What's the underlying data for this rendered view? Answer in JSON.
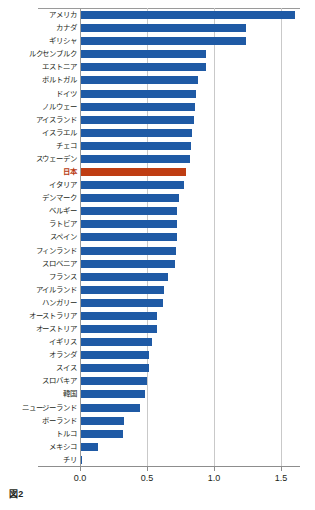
{
  "caption": "図2",
  "chart_data": {
    "type": "bar",
    "orientation": "horizontal",
    "title": "",
    "subtitle": "",
    "xlabel": "",
    "ylabel": "",
    "xlim": [
      0.0,
      1.75
    ],
    "xticks": [
      0.0,
      0.5,
      1.0,
      1.5
    ],
    "xtick_labels": [
      "0.0",
      "0.5",
      "1.0",
      "1.5"
    ],
    "grid": "vertical",
    "legend": "none",
    "bar_color": "#1f5aa5",
    "highlight_color": "#bf3d13",
    "highlight_category": "日本",
    "categories": [
      "アメリカ",
      "カナダ",
      "ギリシャ",
      "ルクセンブルク",
      "エストニア",
      "ポルトガル",
      "ドイツ",
      "ノルウェー",
      "アイスランド",
      "イスラエル",
      "チェコ",
      "スウェーデン",
      "日本",
      "イタリア",
      "デンマーク",
      "ベルギー",
      "ラトビア",
      "スペイン",
      "フィンランド",
      "スロベニア",
      "フランス",
      "アイルランド",
      "ハンガリー",
      "オーストラリア",
      "オーストリア",
      "イギリス",
      "オランダ",
      "スイス",
      "スロバキア",
      "韓国",
      "ニュージーランド",
      "ポーランド",
      "トルコ",
      "メキシコ",
      "チリ"
    ],
    "values": [
      1.6,
      1.23,
      1.23,
      0.93,
      0.93,
      0.87,
      0.86,
      0.85,
      0.84,
      0.83,
      0.82,
      0.81,
      0.78,
      0.77,
      0.73,
      0.72,
      0.72,
      0.72,
      0.71,
      0.7,
      0.65,
      0.62,
      0.61,
      0.57,
      0.57,
      0.53,
      0.51,
      0.51,
      0.49,
      0.48,
      0.44,
      0.32,
      0.31,
      0.13,
      0.01
    ]
  }
}
